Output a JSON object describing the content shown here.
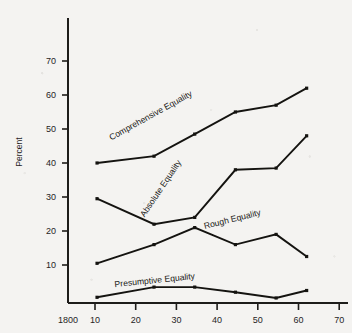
{
  "chart_data": {
    "type": "line",
    "title": "",
    "subtitle": "",
    "xlabel": "",
    "ylabel": "Percent",
    "xlim": [
      0,
      75
    ],
    "ylim": [
      0,
      75
    ],
    "grid": false,
    "legend_position": "inline-labels",
    "x_axis": {
      "tick_values": [
        0,
        10,
        20,
        30,
        40,
        50,
        60,
        70
      ],
      "tick_labels": [
        "1800",
        "10",
        "20",
        "30",
        "40",
        "50",
        "60",
        "70"
      ]
    },
    "y_axis": {
      "tick_values": [
        10,
        20,
        30,
        40,
        50,
        60,
        70
      ],
      "tick_labels": [
        "10",
        "20",
        "30",
        "40",
        "50",
        "60",
        "70"
      ]
    },
    "x": [
      10.5,
      24.5,
      34.5,
      44.5,
      54.5,
      62
    ],
    "series": [
      {
        "name": "Comprehensive Equality",
        "label": "Comprehensive Equality",
        "values": [
          40,
          42,
          48.5,
          55,
          57,
          62
        ]
      },
      {
        "name": "Absolute Equality",
        "label": "Absolute Equality",
        "values": [
          29.5,
          22,
          24,
          38,
          38.5,
          48
        ]
      },
      {
        "name": "Rough Equality",
        "label": "Rough Equality",
        "values": [
          10.5,
          16,
          21,
          16,
          19,
          12.5
        ]
      },
      {
        "name": "Presumptive Equality",
        "label": "Presumptive Equality",
        "values": [
          0.5,
          3.5,
          3.5,
          2,
          0.3,
          2.5
        ]
      }
    ],
    "colors": {
      "line": "#141310",
      "axis": "#1d1c1a",
      "text": "#26241f",
      "background": "#f4f3f1"
    }
  }
}
